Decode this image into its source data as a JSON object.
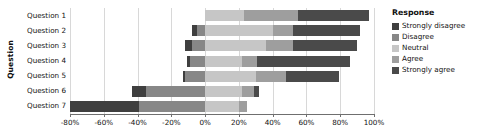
{
  "chart_data": {
    "type": "bar",
    "subtype": "diverging-stacked-likert",
    "title": "",
    "xlabel": "",
    "ylabel": "Question",
    "orientation": "horizontal",
    "grid": true,
    "xlim": [
      -80,
      100
    ],
    "xticks": [
      -80,
      -60,
      -40,
      -20,
      0,
      20,
      40,
      60,
      80,
      100
    ],
    "xtick_labels": [
      "-80%",
      "-60%",
      "-40%",
      "-20%",
      "0%",
      "20%",
      "40%",
      "60%",
      "80%",
      "100%"
    ],
    "categories": [
      "Question 1",
      "Question 2",
      "Question 3",
      "Question 4",
      "Question 5",
      "Question 6",
      "Question 7"
    ],
    "legend": {
      "title": "Response",
      "position": "right",
      "entries": [
        {
          "name": "Strongly disagree",
          "color": "#3f3f3f"
        },
        {
          "name": "Disagree",
          "color": "#878787"
        },
        {
          "name": "Neutral",
          "color": "#c6c6c6"
        },
        {
          "name": "Agree",
          "color": "#9e9e9e"
        },
        {
          "name": "Strongly agree",
          "color": "#4a4a4a"
        }
      ]
    },
    "series": [
      {
        "name": "Strongly disagree",
        "color": "#3f3f3f",
        "values": [
          0,
          -3,
          -4,
          -2,
          -1,
          -8,
          -41
        ]
      },
      {
        "name": "Disagree",
        "color": "#878787",
        "values": [
          0,
          -5,
          -8,
          -9,
          -12,
          -35,
          -39
        ]
      },
      {
        "name": "Neutral",
        "color": "#c6c6c6",
        "values": [
          23,
          40,
          36,
          22,
          30,
          48,
          20
        ]
      },
      {
        "name": "Agree",
        "color": "#9e9e9e",
        "values": [
          32,
          12,
          26,
          12,
          28,
          6,
          5
        ]
      },
      {
        "name": "Strongly agree",
        "color": "#4a4a4a",
        "values": [
          42,
          40,
          42,
          55,
          31,
          3,
          0
        ]
      }
    ],
    "bar_geometry": [
      {
        "category": "Question 1",
        "segments": [
          {
            "name": "Strongly disagree",
            "start": 0,
            "end": 0,
            "color": "#3f3f3f"
          },
          {
            "name": "Disagree",
            "start": 0,
            "end": 0,
            "color": "#878787"
          },
          {
            "name": "Neutral",
            "start": 0,
            "end": 23,
            "color": "#c6c6c6"
          },
          {
            "name": "Agree",
            "start": 23,
            "end": 55,
            "color": "#9e9e9e"
          },
          {
            "name": "Strongly agree",
            "start": 55,
            "end": 97,
            "color": "#4a4a4a"
          }
        ]
      },
      {
        "category": "Question 2",
        "segments": [
          {
            "name": "Strongly disagree",
            "start": -8,
            "end": -5,
            "color": "#3f3f3f"
          },
          {
            "name": "Disagree",
            "start": -5,
            "end": 0,
            "color": "#878787"
          },
          {
            "name": "Neutral",
            "start": 0,
            "end": 40,
            "color": "#c6c6c6"
          },
          {
            "name": "Agree",
            "start": 40,
            "end": 52,
            "color": "#9e9e9e"
          },
          {
            "name": "Strongly agree",
            "start": 52,
            "end": 92,
            "color": "#4a4a4a"
          }
        ]
      },
      {
        "category": "Question 3",
        "segments": [
          {
            "name": "Strongly disagree",
            "start": -12,
            "end": -8,
            "color": "#3f3f3f"
          },
          {
            "name": "Disagree",
            "start": -8,
            "end": 0,
            "color": "#878787"
          },
          {
            "name": "Neutral",
            "start": 0,
            "end": 36,
            "color": "#c6c6c6"
          },
          {
            "name": "Agree",
            "start": 36,
            "end": 52,
            "color": "#9e9e9e"
          },
          {
            "name": "Strongly agree",
            "start": 52,
            "end": 90,
            "color": "#4a4a4a"
          }
        ]
      },
      {
        "category": "Question 4",
        "segments": [
          {
            "name": "Strongly disagree",
            "start": -11,
            "end": -9,
            "color": "#3f3f3f"
          },
          {
            "name": "Disagree",
            "start": -9,
            "end": 0,
            "color": "#878787"
          },
          {
            "name": "Neutral",
            "start": 0,
            "end": 22,
            "color": "#c6c6c6"
          },
          {
            "name": "Agree",
            "start": 22,
            "end": 31,
            "color": "#9e9e9e"
          },
          {
            "name": "Strongly agree",
            "start": 31,
            "end": 86,
            "color": "#4a4a4a"
          }
        ]
      },
      {
        "category": "Question 5",
        "segments": [
          {
            "name": "Strongly disagree",
            "start": -13,
            "end": -12,
            "color": "#3f3f3f"
          },
          {
            "name": "Disagree",
            "start": -12,
            "end": 0,
            "color": "#878787"
          },
          {
            "name": "Neutral",
            "start": 0,
            "end": 30,
            "color": "#c6c6c6"
          },
          {
            "name": "Agree",
            "start": 30,
            "end": 48,
            "color": "#9e9e9e"
          },
          {
            "name": "Strongly agree",
            "start": 48,
            "end": 79,
            "color": "#4a4a4a"
          }
        ]
      },
      {
        "category": "Question 6",
        "segments": [
          {
            "name": "Strongly disagree",
            "start": -43,
            "end": -35,
            "color": "#3f3f3f"
          },
          {
            "name": "Disagree",
            "start": -35,
            "end": 0,
            "color": "#878787"
          },
          {
            "name": "Neutral",
            "start": 0,
            "end": 22,
            "color": "#c6c6c6"
          },
          {
            "name": "Agree",
            "start": 22,
            "end": 29,
            "color": "#9e9e9e"
          },
          {
            "name": "Strongly agree",
            "start": 29,
            "end": 32,
            "color": "#4a4a4a"
          }
        ]
      },
      {
        "category": "Question 7",
        "segments": [
          {
            "name": "Strongly disagree",
            "start": -80,
            "end": -39,
            "color": "#3f3f3f"
          },
          {
            "name": "Disagree",
            "start": -39,
            "end": 0,
            "color": "#878787"
          },
          {
            "name": "Neutral",
            "start": 0,
            "end": 20,
            "color": "#c6c6c6"
          },
          {
            "name": "Agree",
            "start": 20,
            "end": 25,
            "color": "#9e9e9e"
          },
          {
            "name": "Strongly agree",
            "start": 25,
            "end": 25,
            "color": "#4a4a4a"
          }
        ]
      }
    ]
  }
}
